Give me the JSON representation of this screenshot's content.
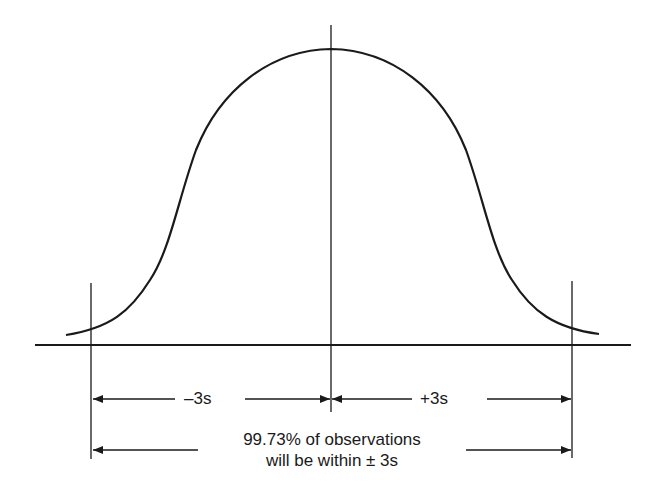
{
  "diagram": {
    "type": "normal-distribution-bell-curve",
    "labels": {
      "left_span": "–3s",
      "right_span": "+3s",
      "caption_line1": "99.73% of observations",
      "caption_line2": "will be within ± 3s"
    },
    "markers": {
      "left": "-3s",
      "center": "mean",
      "right": "+3s"
    },
    "colors": {
      "line": "#1a1a1a",
      "background": "#ffffff"
    }
  }
}
